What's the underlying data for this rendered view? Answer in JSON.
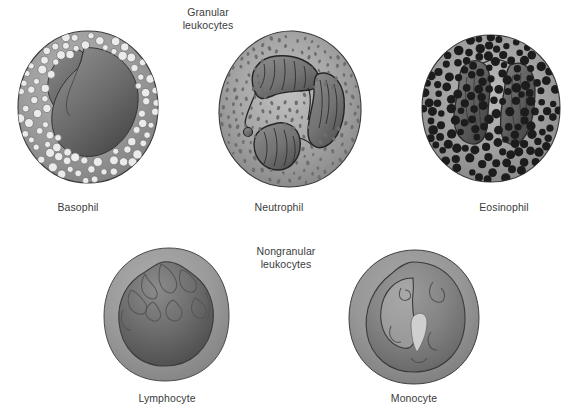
{
  "figure": {
    "background_color": "#ffffff",
    "width": 570,
    "height": 419
  },
  "headings": {
    "granular": "Granular\nleukocytes",
    "nongranular": "Nongranular\nleukocytes"
  },
  "palette": {
    "cytoplasm_light": "#a3a3a3",
    "cytoplasm_mid": "#949494",
    "cytoplasm_dark": "#7d7d7d",
    "nucleus_mid": "#7a7a7a",
    "nucleus_dark": "#5a5a5a",
    "nucleus_deep": "#4a4a4a",
    "granule_light": "#ebebeb",
    "granule_dark": "#1c1c1c",
    "granule_mid": "#6e6e6e",
    "outline": "#2b2b2b",
    "label_text": "#3b3b3b",
    "vacuole": "#c9c9c9"
  },
  "cells": [
    {
      "id": "basophil",
      "label": "Basophil",
      "group": "granular",
      "nucleus_shape": "bilobed",
      "granule_type": "large-light",
      "granule_count": 120,
      "label_x": 78,
      "label_y": 207,
      "cell_x": 14,
      "cell_y": 28,
      "cell_w": 148,
      "cell_h": 158
    },
    {
      "id": "neutrophil",
      "label": "Neutrophil",
      "group": "granular",
      "nucleus_shape": "multilobed",
      "granule_type": "fine-dark",
      "granule_count": 190,
      "label_x": 279,
      "label_y": 207,
      "cell_x": 214,
      "cell_y": 28,
      "cell_w": 152,
      "cell_h": 162
    },
    {
      "id": "eosinophil",
      "label": "Eosinophil",
      "group": "granular",
      "nucleus_shape": "bilobed",
      "granule_type": "large-dark",
      "granule_count": 150,
      "label_x": 504,
      "label_y": 207,
      "cell_x": 419,
      "cell_y": 33,
      "cell_w": 144,
      "cell_h": 152
    },
    {
      "id": "lymphocyte",
      "label": "Lymphocyte",
      "group": "nongranular",
      "nucleus_shape": "round-large",
      "granule_type": "none",
      "granule_count": 0,
      "label_x": 167,
      "label_y": 398,
      "cell_x": 101,
      "cell_y": 246,
      "cell_w": 132,
      "cell_h": 138
    },
    {
      "id": "monocyte",
      "label": "Monocyte",
      "group": "nongranular",
      "nucleus_shape": "kidney",
      "granule_type": "none",
      "granule_count": 0,
      "label_x": 414,
      "label_y": 398,
      "cell_x": 345,
      "cell_y": 248,
      "cell_w": 138,
      "cell_h": 138
    }
  ]
}
